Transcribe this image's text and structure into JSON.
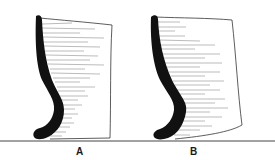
{
  "figure": {
    "type": "pottery profile drawings",
    "colors": {
      "profile_fill": "#111111",
      "outline": "#333333",
      "hatching": "#555555",
      "baseline": "#444444",
      "background": "#ffffff"
    },
    "vessels": [
      {
        "id": "A",
        "label": "A"
      },
      {
        "id": "B",
        "label": "B"
      }
    ]
  }
}
